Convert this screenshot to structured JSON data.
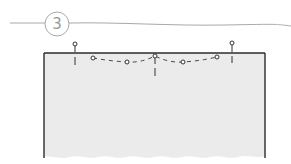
{
  "step": {
    "number": "3"
  },
  "colors": {
    "line": "#9c9c9c",
    "panel_fill": "#ebebeb",
    "panel_edge": "#2b2b2b",
    "pin": "#3a3a3a",
    "background": "#ffffff"
  },
  "panel": {
    "left": 44,
    "right": 265,
    "top": 53,
    "bottom": 158
  },
  "pins": [
    {
      "name": "left-edge-pin",
      "x": 75,
      "head_y": 44,
      "end_y": 65
    },
    {
      "name": "center-pin",
      "x": 155,
      "head_y": 56,
      "end_y": 76
    },
    {
      "name": "right-edge-pin",
      "x": 232,
      "head_y": 43,
      "end_y": 63
    }
  ],
  "stitch_points": [
    {
      "x": 93,
      "y": 58
    },
    {
      "x": 127,
      "y": 62
    },
    {
      "x": 155,
      "y": 56
    },
    {
      "x": 183,
      "y": 62
    },
    {
      "x": 217,
      "y": 57
    }
  ]
}
